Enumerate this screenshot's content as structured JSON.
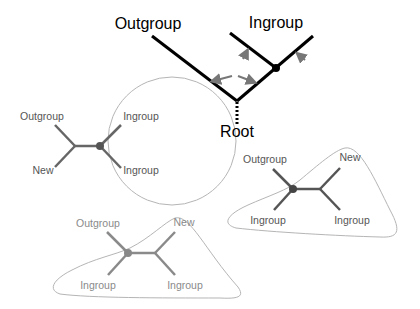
{
  "diagram": {
    "type": "phylogenetic-tree-rooting",
    "top_tree": {
      "labels": {
        "outgroup": "Outgroup",
        "ingroup": "Ingroup",
        "root": "Root"
      },
      "colors": {
        "branch": "#000000",
        "arrow": "#777777"
      }
    },
    "left_tree": {
      "labels": {
        "outgroup": "Outgroup",
        "new": "New",
        "ingroup_top": "Ingroup",
        "ingroup_bottom": "Ingroup"
      },
      "colors": {
        "branch": "#666666",
        "circle": "#aaaaaa"
      }
    },
    "right_tree": {
      "labels": {
        "outgroup": "Outgroup",
        "new": "New",
        "ingroup_left": "Ingroup",
        "ingroup_right": "Ingroup"
      },
      "colors": {
        "branch": "#555555",
        "outline": "#aaaaaa"
      }
    },
    "bottom_tree": {
      "labels": {
        "outgroup": "Outgroup",
        "new": "New",
        "ingroup_left": "Ingroup",
        "ingroup_right": "Ingroup"
      },
      "colors": {
        "branch": "#888888",
        "outline": "#aaaaaa"
      }
    }
  }
}
